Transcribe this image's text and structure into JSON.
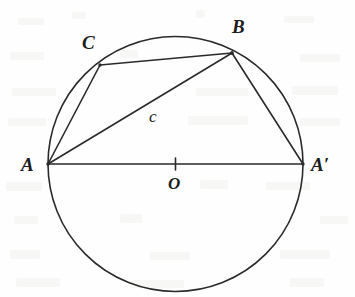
{
  "figure": {
    "kind": "circle-geometry-diagram",
    "canvas": {
      "width": 355,
      "height": 297
    },
    "colors": {
      "background": "#fefefe",
      "stroke": "#2a2a2a",
      "label": "#1d1d1d"
    },
    "stroke_width": 1.6
  },
  "circle": {
    "name": "main-circle",
    "center": {
      "x": 175.5,
      "y": 164
    },
    "radius": 127.5
  },
  "points": [
    {
      "id": "A",
      "label": "A",
      "x": 48,
      "y": 164,
      "on_circle": true,
      "label_pos": {
        "x": 21,
        "y": 155
      }
    },
    {
      "id": "Ap",
      "label": "A′",
      "x": 303,
      "y": 164,
      "on_circle": true,
      "label_pos": {
        "x": 311,
        "y": 155
      }
    },
    {
      "id": "B",
      "label": "B",
      "x": 232,
      "y": 53,
      "on_circle": true,
      "label_pos": {
        "x": 232,
        "y": 17
      }
    },
    {
      "id": "C",
      "label": "C",
      "x": 100,
      "y": 65,
      "on_circle": true,
      "label_pos": {
        "x": 82,
        "y": 33
      }
    },
    {
      "id": "O",
      "label": "O",
      "x": 175.5,
      "y": 164,
      "on_circle": false,
      "label_pos": {
        "x": 168,
        "y": 175
      }
    }
  ],
  "segments": [
    {
      "id": "AAp",
      "from": "A",
      "to": "Ap",
      "role": "diameter",
      "label": ""
    },
    {
      "id": "AC",
      "from": "A",
      "to": "C",
      "role": "chord",
      "label": ""
    },
    {
      "id": "CB",
      "from": "C",
      "to": "B",
      "role": "chord",
      "label": ""
    },
    {
      "id": "AB",
      "from": "A",
      "to": "B",
      "role": "chord",
      "label": "c"
    },
    {
      "id": "BAp",
      "from": "B",
      "to": "Ap",
      "role": "chord",
      "label": ""
    }
  ],
  "marks": [
    {
      "id": "center-tick",
      "type": "tick",
      "at": {
        "x": 175.5,
        "y": 164
      },
      "orientation": "vertical",
      "half_length": 6
    }
  ],
  "labels": {
    "A": "A",
    "A_prime": "A′",
    "B": "B",
    "C": "C",
    "O": "O",
    "c": "c"
  }
}
